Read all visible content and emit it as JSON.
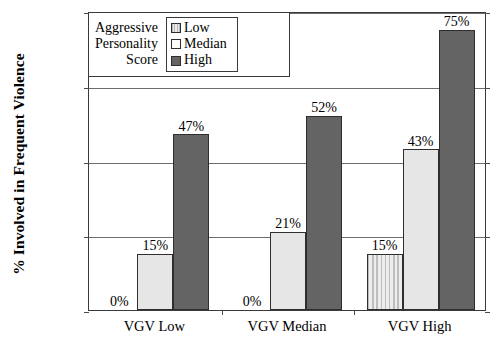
{
  "chart_data": {
    "type": "bar",
    "title": "",
    "subtitle": "",
    "xlabel": "",
    "ylabel": "% Involved in Frequent Violence",
    "categories": [
      "VGV Low",
      "VGV Median",
      "VGV High"
    ],
    "series": [
      {
        "name": "Low",
        "values": [
          0,
          0,
          15
        ],
        "labels": [
          "0%",
          "0%",
          "15%"
        ],
        "color": "#d9d9d9",
        "pattern": "vertical-stripes"
      },
      {
        "name": "Median",
        "values": [
          15,
          21,
          43
        ],
        "labels": [
          "15%",
          "21%",
          "43%"
        ],
        "color": "#e6e6e6",
        "pattern": "solid"
      },
      {
        "name": "High",
        "values": [
          47,
          52,
          75
        ],
        "labels": [
          "47%",
          "52%",
          "75%"
        ],
        "color": "#646464",
        "pattern": "solid"
      }
    ],
    "ylim": [
      0,
      80
    ],
    "yticks": [
      0,
      20,
      40,
      60,
      80
    ],
    "ytick_labels": [
      "0%",
      "20%",
      "40%",
      "60%",
      "80%"
    ],
    "grid": true,
    "legend_position": "top-left-inside"
  },
  "legend": {
    "caption_lines": [
      "Aggressive",
      "Personality",
      "Score"
    ],
    "entries": [
      {
        "label": "Low"
      },
      {
        "label": "Median"
      },
      {
        "label": "High"
      }
    ]
  }
}
